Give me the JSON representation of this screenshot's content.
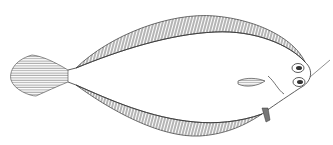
{
  "image": {
    "subject": "flatfish line drawing",
    "background": "#ffffff",
    "ink": "#333333"
  }
}
